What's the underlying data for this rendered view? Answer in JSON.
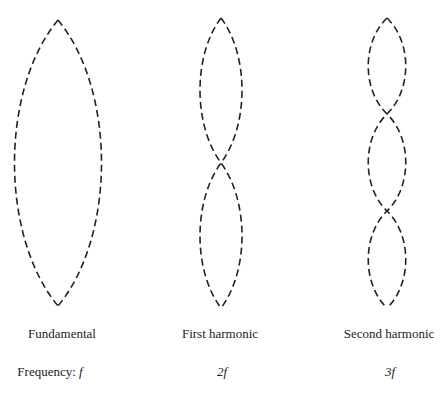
{
  "diagram": {
    "columns": [
      {
        "name": "Fundamental",
        "frequency_prefix": "Frequency: ",
        "frequency": "f"
      },
      {
        "name": "First harmonic",
        "frequency_prefix": "",
        "frequency": "2f"
      },
      {
        "name": "Second harmonic",
        "frequency_prefix": "",
        "frequency": "3f"
      }
    ],
    "line_style": "dashed",
    "stroke_color": "#222222"
  }
}
